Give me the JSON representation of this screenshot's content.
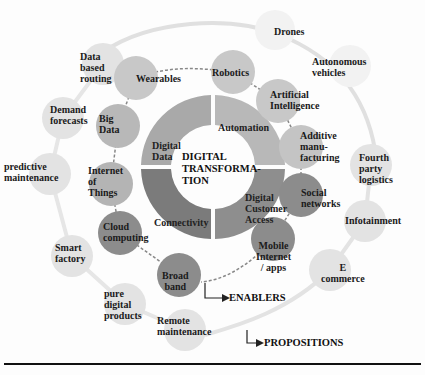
{
  "diagram": {
    "center": {
      "title_lines": [
        "DIGITAL",
        "TRANSFORMA-",
        "TION"
      ]
    },
    "ring_segments": [
      {
        "label": "Digital Data",
        "lines": [
          "Digital",
          "Data"
        ],
        "color": "#a9a9a9"
      },
      {
        "label": "Automation",
        "lines": [
          "Automation"
        ],
        "color": "#b8b8b8"
      },
      {
        "label": "Digital Customer Access",
        "lines": [
          "Digital",
          "Customer",
          "Access"
        ],
        "color": "#8e8e8e"
      },
      {
        "label": "Connectivity",
        "lines": [
          "Connectivity"
        ],
        "color": "#7b7b7b"
      }
    ],
    "enablers": [
      {
        "lines": [
          "Wearables"
        ]
      },
      {
        "lines": [
          "Robotics"
        ]
      },
      {
        "lines": [
          "Artificial",
          "Intelligence"
        ]
      },
      {
        "lines": [
          "Additive",
          "manu-",
          "facturing"
        ]
      },
      {
        "lines": [
          "Social",
          "networks"
        ]
      },
      {
        "lines": [
          "Mobile",
          "Internet",
          "/ apps"
        ]
      },
      {
        "lines": [
          "Broad",
          "band"
        ]
      },
      {
        "lines": [
          "Cloud",
          "computing"
        ]
      },
      {
        "lines": [
          "Internet",
          "of",
          "Things"
        ]
      },
      {
        "lines": [
          "Big",
          "Data"
        ]
      }
    ],
    "propositions": [
      {
        "lines": [
          "Data",
          "based",
          "routing"
        ]
      },
      {
        "lines": [
          "Demand",
          "forecasts"
        ]
      },
      {
        "lines": [
          "predictive",
          "maintenance"
        ]
      },
      {
        "lines": [
          "Smart",
          "factory"
        ]
      },
      {
        "lines": [
          "pure",
          "digital",
          "products"
        ]
      },
      {
        "lines": [
          "Remote",
          "maintenance"
        ]
      },
      {
        "lines": [
          "Drones"
        ]
      },
      {
        "lines": [
          "Autonomous",
          "vehicles"
        ]
      },
      {
        "lines": [
          "Fourth",
          "party",
          "logistics"
        ]
      },
      {
        "lines": [
          "Infotainment"
        ]
      },
      {
        "lines": [
          "E",
          "commerce"
        ]
      }
    ],
    "legend": {
      "enablers": "ENABLERS",
      "propositions": "PROPOSITIONS"
    },
    "colors": {
      "enabler_light": "#c4c4c4",
      "enabler_dark": "#8a8a8a",
      "proposition": "#e3e3e3",
      "connector": "#7a7a7a"
    }
  }
}
